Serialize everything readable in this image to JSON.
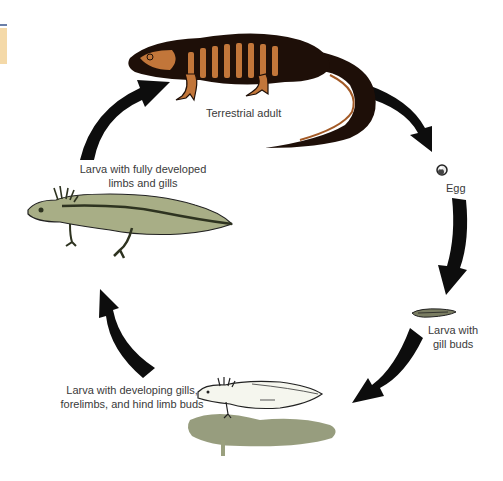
{
  "diagram": {
    "stages": [
      {
        "id": "adult",
        "label_lines": [
          "Terrestrial adult"
        ],
        "icon": "adult-salamander"
      },
      {
        "id": "egg",
        "label_lines": [
          "Egg"
        ],
        "icon": "egg"
      },
      {
        "id": "gill-buds",
        "label_lines": [
          "Larva with",
          "gill buds"
        ],
        "icon": "larva-gill-buds"
      },
      {
        "id": "developing",
        "label_lines": [
          "Larva with developing gills,",
          "forelimbs, and hind limb buds"
        ],
        "icon": "larva-developing"
      },
      {
        "id": "fully",
        "label_lines": [
          "Larva with fully developed",
          "limbs and gills"
        ],
        "icon": "larva-fully-developed"
      }
    ],
    "cycle_direction": "clockwise",
    "colors": {
      "arrow": "#0d0d0d",
      "adult_body": "#1e0f08",
      "adult_stripe": "#c2763a",
      "larva_green": "#a8ae86",
      "larva_dark": "#2e3320",
      "shadow_green": "#8c9270",
      "text": "#3a3a3a",
      "corner_tab": "#f4d9a8"
    }
  }
}
